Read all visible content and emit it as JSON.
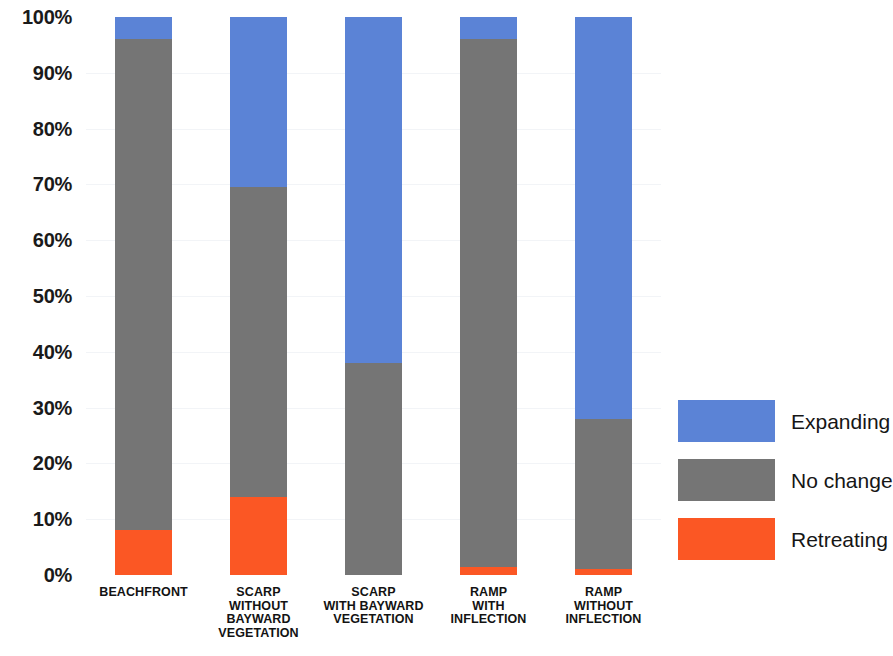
{
  "chart_data": {
    "type": "bar",
    "stacked": true,
    "stack_mode": "percent",
    "title": "",
    "xlabel": "",
    "ylabel": "",
    "ylim": [
      0,
      100
    ],
    "grid": false,
    "legend_position": "right",
    "categories": [
      "BEACHFRONT",
      "SCARP\nWITHOUT\nBAYWARD\nVEGETATION",
      "SCARP\nWITH BAYWARD\nVEGETATION",
      "RAMP\nWITH\nINFLECTION",
      "RAMP\nWITHOUT\nINFLECTION"
    ],
    "series": [
      {
        "name": "Retreating",
        "color": "#FB5724",
        "values": [
          8,
          14,
          0,
          1.5,
          1
        ]
      },
      {
        "name": "No change",
        "color": "#757575",
        "values": [
          88,
          55.5,
          38,
          94.5,
          27
        ]
      },
      {
        "name": "Expanding",
        "color": "#5B83D6",
        "values": [
          4,
          30.5,
          62,
          4,
          72
        ]
      }
    ],
    "y_ticks": [
      {
        "value": 100,
        "label": "100%"
      },
      {
        "value": 90,
        "label": "90%"
      },
      {
        "value": 80,
        "label": "80%"
      },
      {
        "value": 70,
        "label": "70%"
      },
      {
        "value": 60,
        "label": "60%"
      },
      {
        "value": 50,
        "label": "50%"
      },
      {
        "value": 40,
        "label": "40%"
      },
      {
        "value": 30,
        "label": "30%"
      },
      {
        "value": 20,
        "label": "20%"
      },
      {
        "value": 10,
        "label": "10%"
      },
      {
        "value": 0,
        "label": "0%"
      }
    ],
    "legend": [
      {
        "label": "Expanding",
        "color": "#5B83D6"
      },
      {
        "label": "No change",
        "color": "#757575"
      },
      {
        "label": "Retreating",
        "color": "#FB5724"
      }
    ]
  }
}
